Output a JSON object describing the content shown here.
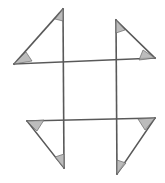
{
  "figure": {
    "canvas": {
      "width": 165,
      "height": 183,
      "background": "#ffffff"
    },
    "style": {
      "line_color": "#595959",
      "line_width": 1.6,
      "angle_marker_fill": "#b0b0b0",
      "angle_marker_stroke": "#6a6a6a"
    },
    "vertices": {
      "top_left_apex": {
        "x": 63,
        "y": 9
      },
      "top_left_left": {
        "x": 14,
        "y": 64
      },
      "top_right_apex": {
        "x": 116,
        "y": 20
      },
      "top_right_right": {
        "x": 155,
        "y": 58
      },
      "bottom_left_left": {
        "x": 27,
        "y": 121
      },
      "bottom_left_apex": {
        "x": 64,
        "y": 168
      },
      "bottom_right_right": {
        "x": 155,
        "y": 118
      },
      "bottom_right_apex": {
        "x": 117,
        "y": 174
      }
    },
    "lines": [
      {
        "name": "vertical-left",
        "x1": 63,
        "y1": 9,
        "x2": 64,
        "y2": 168
      },
      {
        "name": "vertical-right",
        "x1": 116,
        "y1": 20,
        "x2": 117,
        "y2": 174
      },
      {
        "name": "horizontal-top",
        "x1": 14,
        "y1": 64,
        "x2": 155,
        "y2": 58
      },
      {
        "name": "horizontal-bottom",
        "x1": 27,
        "y1": 121,
        "x2": 155,
        "y2": 118
      }
    ],
    "hypotenuses": [
      {
        "name": "top-left-hypotenuse",
        "x1": 14,
        "y1": 64,
        "x2": 63,
        "y2": 9
      },
      {
        "name": "top-right-hypotenuse",
        "x1": 116,
        "y1": 20,
        "x2": 155,
        "y2": 58
      },
      {
        "name": "bottom-left-hypotenuse",
        "x1": 27,
        "y1": 121,
        "x2": 64,
        "y2": 168
      },
      {
        "name": "bottom-right-hypotenuse",
        "x1": 155,
        "y1": 118,
        "x2": 117,
        "y2": 174
      }
    ],
    "angle_markers": [
      {
        "name": "angle-top-left-apex",
        "points": "63,9 63,21 55,19"
      },
      {
        "name": "angle-top-left-left",
        "points": "14,64 32,61 26,52"
      },
      {
        "name": "angle-top-right-apex",
        "points": "116,20 116,33 125,30"
      },
      {
        "name": "angle-top-right-right",
        "points": "155,58 139,60 143,50"
      },
      {
        "name": "angle-bottom-left-left",
        "points": "27,121 44,120 37,131"
      },
      {
        "name": "angle-bottom-left-apex",
        "points": "64,168 64,154 55,157"
      },
      {
        "name": "angle-bottom-right-right",
        "points": "155,118 138,119 145,130"
      },
      {
        "name": "angle-bottom-right-apex",
        "points": "117,174 117,160 126,163"
      }
    ]
  }
}
